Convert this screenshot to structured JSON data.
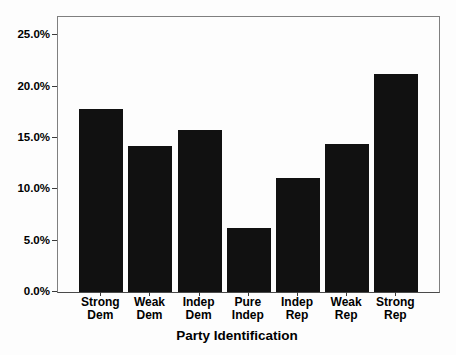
{
  "figure": {
    "background": "#fdfdfd",
    "bar_color": "#111111",
    "frame_color": "#7f7f7f",
    "tick_color": "#3a3a3a",
    "text_color": "#000000"
  },
  "chart_data": {
    "type": "bar",
    "title": "",
    "xlabel": "Party Identification",
    "ylabel": "",
    "unit": "%",
    "categories": [
      "Strong Dem",
      "Weak Dem",
      "Indep Dem",
      "Pure Indep",
      "Indep Rep",
      "Weak Rep",
      "Strong Rep"
    ],
    "category_lines": [
      [
        "Strong",
        "Dem"
      ],
      [
        "Weak",
        "Dem"
      ],
      [
        "Indep",
        "Dem"
      ],
      [
        "Pure",
        "Indep"
      ],
      [
        "Indep",
        "Rep"
      ],
      [
        "Weak",
        "Rep"
      ],
      [
        "Strong",
        "Rep"
      ]
    ],
    "values": [
      17.8,
      14.2,
      15.8,
      6.2,
      11.1,
      14.4,
      21.2
    ],
    "y_ticks": [
      {
        "value": 0,
        "label": "0.0%"
      },
      {
        "value": 5,
        "label": "5.0%"
      },
      {
        "value": 10,
        "label": "10.0%"
      },
      {
        "value": 15,
        "label": "15.0%"
      },
      {
        "value": 20,
        "label": "20.0%"
      },
      {
        "value": 25,
        "label": "25.0%"
      }
    ],
    "ylim": [
      0,
      26.8
    ],
    "grid": false,
    "legend": null
  }
}
